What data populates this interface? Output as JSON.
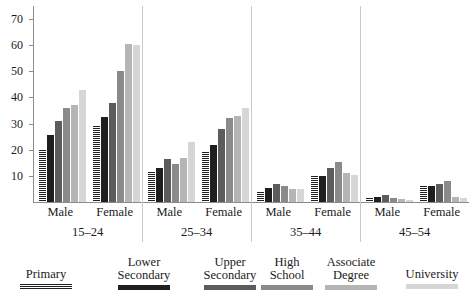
{
  "chart_data": {
    "type": "bar",
    "title": "",
    "xlabel": "",
    "ylabel": "",
    "ylim": [
      0,
      75
    ],
    "grid": false,
    "legend_position": "bottom",
    "yticks": [
      10,
      20,
      30,
      40,
      50,
      60,
      70
    ],
    "categories": [
      "Male 15-24",
      "Female 15-24",
      "Male 25-34",
      "Female 25-34",
      "Male 35-44",
      "Female 35-44",
      "Male 45-54",
      "Female 45-54"
    ],
    "age_groups": [
      "15–24",
      "25–34",
      "35–44",
      "45–54"
    ],
    "sex_labels": [
      "Male",
      "Female",
      "Male",
      "Female",
      "Male",
      "Female",
      "Male",
      "Female"
    ],
    "series": [
      {
        "name": "Primary",
        "color": "#1f1f1f",
        "pattern": "hatched",
        "values": [
          20.0,
          29.0,
          11.5,
          19.0,
          4.0,
          10.0,
          1.5,
          6.0
        ]
      },
      {
        "name": "Lower Secondary",
        "color": "#1f1f1f",
        "pattern": "solid",
        "values": [
          25.5,
          32.5,
          13.0,
          22.0,
          5.5,
          10.0,
          2.0,
          6.0
        ]
      },
      {
        "name": "Upper Secondary",
        "color": "#5c5c5c",
        "pattern": "solid",
        "values": [
          31.0,
          38.0,
          16.5,
          28.0,
          7.0,
          13.0,
          2.5,
          7.0
        ]
      },
      {
        "name": "High School",
        "color": "#8a8a8a",
        "pattern": "solid",
        "values": [
          36.0,
          50.0,
          14.5,
          32.0,
          6.0,
          15.5,
          1.5,
          8.0
        ]
      },
      {
        "name": "Associate Degree",
        "color": "#b5b5b5",
        "pattern": "solid",
        "values": [
          37.0,
          60.5,
          17.0,
          33.0,
          5.0,
          11.0,
          1.0,
          2.0
        ]
      },
      {
        "name": "University",
        "color": "#d6d6d6",
        "pattern": "solid",
        "values": [
          43.0,
          60.0,
          23.0,
          36.0,
          5.0,
          10.5,
          0.8,
          1.5
        ]
      }
    ]
  },
  "legend": {
    "items": [
      {
        "label": "Primary",
        "swatch_class": "sw-primary"
      },
      {
        "label": "Lower\nSecondary",
        "swatch_class": "sw-lower"
      },
      {
        "label": "Upper\nSecondary",
        "swatch_class": "sw-upper"
      },
      {
        "label": "High\nSchool",
        "swatch_class": "sw-high"
      },
      {
        "label": "Associate\nDegree",
        "swatch_class": "sw-assoc"
      },
      {
        "label": "University",
        "swatch_class": "sw-univ"
      }
    ]
  },
  "colors": {
    "axis": "#8c8c8c",
    "separator": "#c9c9c9",
    "text": "#1a1a1a",
    "background": "#ffffff"
  }
}
